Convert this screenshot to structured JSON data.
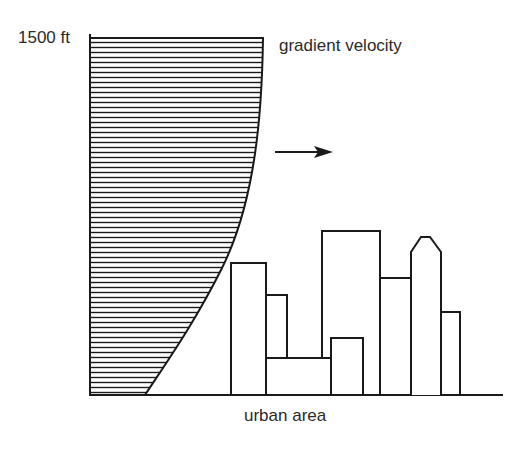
{
  "diagram": {
    "height_label": "1500 ft",
    "profile_label": "gradient velocity",
    "ground_label": "urban area",
    "arrow": "wind-direction-arrow",
    "colors": {
      "line": "#1a1a1a",
      "background": "#ffffff"
    },
    "buildings": [
      {
        "x": 231,
        "top": 263,
        "right": 266
      },
      {
        "x": 266,
        "top": 295,
        "right": 287
      },
      {
        "x": 266,
        "top": 358,
        "right": 331
      },
      {
        "x": 322,
        "top": 231,
        "right": 380
      },
      {
        "x": 331,
        "top": 338,
        "right": 363
      },
      {
        "x": 380,
        "top": 278,
        "right": 411
      },
      {
        "x": 411,
        "top": 237,
        "right": 441,
        "shape": "pointed"
      },
      {
        "x": 441,
        "top": 312,
        "right": 460
      }
    ]
  }
}
